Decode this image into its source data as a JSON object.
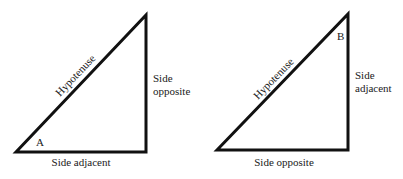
{
  "colors": {
    "stroke": "#111111",
    "text": "#1a1a1a",
    "background": "#ffffff"
  },
  "triangles": [
    {
      "id": "left",
      "angle_label": "A",
      "hypotenuse_label": "Hypotenuse",
      "vertical_side_label": [
        "Side",
        "opposite"
      ],
      "bottom_side_label": "Side adjacent"
    },
    {
      "id": "right",
      "angle_label": "B",
      "hypotenuse_label": "Hypotenuse",
      "vertical_side_label": [
        "Side",
        "adjacent"
      ],
      "bottom_side_label": "Side opposite"
    }
  ]
}
